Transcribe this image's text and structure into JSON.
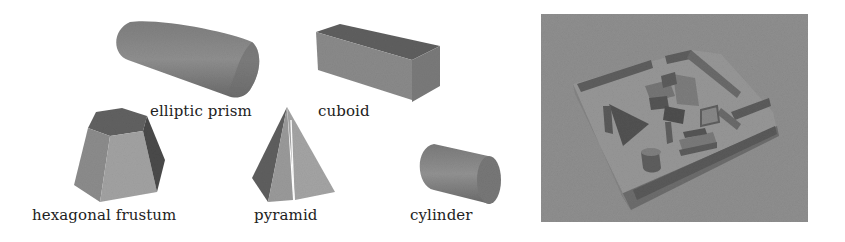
{
  "figure": {
    "panels": [
      {
        "id": "primitives",
        "labels": [
          {
            "key": "elliptic_prism",
            "text": "elliptic prism"
          },
          {
            "key": "cuboid",
            "text": "cuboid"
          },
          {
            "key": "hexagonal_frustum",
            "text": "hexagonal frustum"
          },
          {
            "key": "pyramid",
            "text": "pyramid"
          },
          {
            "key": "cylinder",
            "text": "cylinder"
          }
        ]
      },
      {
        "id": "scene",
        "description": "rendered tray containing shapes"
      }
    ]
  },
  "labels": {
    "elliptic_prism": "elliptic prism",
    "cuboid": "cuboid",
    "hexagonal_frustum": "hexagonal frustum",
    "pyramid": "pyramid",
    "cylinder": "cylinder"
  },
  "colors": {
    "background": "#ffffff",
    "scene_background": "#8e8e8e",
    "shape_mid": "#8a8a8a",
    "shape_dark": "#5c5c5c",
    "shape_light": "#a8a8a8",
    "label_text": "#222222"
  }
}
